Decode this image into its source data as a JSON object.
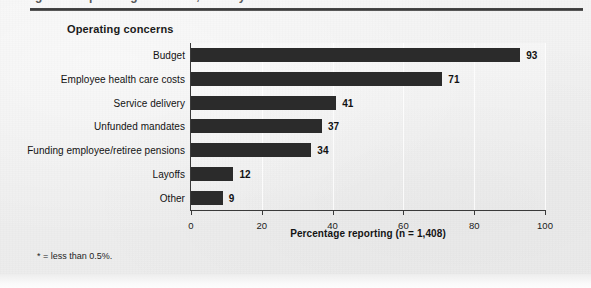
{
  "figure": {
    "top_rule": "rule",
    "clipped_headline": "Figure 3. Operating concerns, fiscal year",
    "section_title": "Operating concerns",
    "footnote": "* = less than 0.5%."
  },
  "chart_data": {
    "type": "bar",
    "orientation": "horizontal",
    "title": "Operating concerns",
    "xlabel": "Percentage reporting (n = 1,408)",
    "ylabel": "",
    "categories": [
      "Budget",
      "Employee health care costs",
      "Service delivery",
      "Unfunded mandates",
      "Funding employee/retiree pensions",
      "Layoffs",
      "Other"
    ],
    "values": [
      93,
      71,
      41,
      37,
      34,
      12,
      9
    ],
    "data_labels": [
      "93",
      "71",
      "41",
      "37",
      "34",
      "12",
      "9"
    ],
    "xlim": [
      0,
      100
    ],
    "xticks": [
      0,
      20,
      40,
      60,
      80,
      100
    ],
    "xtick_labels": [
      "0",
      "20",
      "40",
      "60",
      "80",
      "100"
    ],
    "grid": "vertical-light",
    "legend": "none",
    "bar_color": "#2b2b2b",
    "note": "* = less than 0.5%."
  }
}
